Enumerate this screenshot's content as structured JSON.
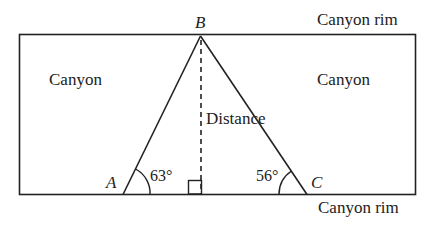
{
  "diagram": {
    "type": "geometry-triangle-canyon",
    "labels": {
      "rim_top": "Canyon rim",
      "rim_bottom": "Canyon rim",
      "canyon_left": "Canyon",
      "canyon_right": "Canyon",
      "distance": "Distance"
    },
    "vertices": {
      "A": {
        "label": "A",
        "angle": "63°"
      },
      "B": {
        "label": "B"
      },
      "C": {
        "label": "C",
        "angle": "56°"
      }
    },
    "right_angle_marker": true,
    "colors": {
      "line": "#222222",
      "background": "#ffffff"
    }
  }
}
